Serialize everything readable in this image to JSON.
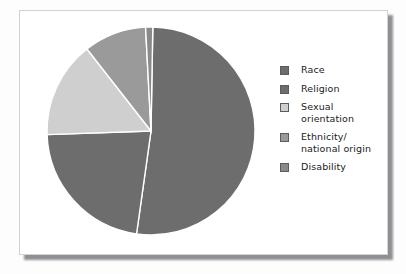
{
  "figure": {
    "background_color": "#fdfdfd",
    "panel_background": "#ffffff",
    "panel_border_color": "#d2d2d2",
    "shadow_color": "#8f9093"
  },
  "chart_data": {
    "type": "pie",
    "title": "",
    "subtitle": "",
    "xlabel": "",
    "ylabel": "",
    "grid": false,
    "legend_position": "right",
    "separator_color": "#ffffff",
    "start_angle_deg": 0,
    "direction": "clockwise",
    "categories": [
      "Race",
      "Religion",
      "Sexual orientation",
      "Ethnicity/ national origin",
      "Disability"
    ],
    "values": [
      52,
      22,
      15,
      10,
      1
    ],
    "units": "percent",
    "slices": [
      {
        "label": "Race",
        "value": 52,
        "color": "#6d6d6d",
        "start_deg": 1,
        "end_deg": 188
      },
      {
        "label": "Religion",
        "value": 22,
        "color": "#6d6d6d",
        "start_deg": 188,
        "end_deg": 268
      },
      {
        "label": "Sexual orientation",
        "value": 15,
        "color": "#cfcfcf",
        "start_deg": 268,
        "end_deg": 322
      },
      {
        "label": "Ethnicity/ national origin",
        "value": 10,
        "color": "#9a9a9a",
        "start_deg": 322,
        "end_deg": 357
      },
      {
        "label": "Disability",
        "value": 1,
        "color": "#8a8a8a",
        "start_deg": 357,
        "end_deg": 361
      }
    ]
  },
  "legend": {
    "items": [
      {
        "label": "Race",
        "color": "#6d6d6d"
      },
      {
        "label": "Religion",
        "color": "#6d6d6d"
      },
      {
        "label": "Sexual\norientation",
        "color": "#cfcfcf"
      },
      {
        "label": "Ethnicity/\nnational origin",
        "color": "#9a9a9a"
      },
      {
        "label": "Disability",
        "color": "#8a8a8a"
      }
    ]
  }
}
